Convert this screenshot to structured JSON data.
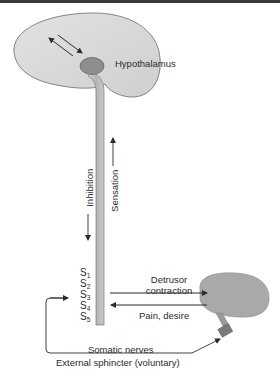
{
  "diagram": {
    "labels": {
      "hypothalamus": "Hypothalamus",
      "inhibition": "Inhibition",
      "sensation": "Sensation",
      "detrusor_line1": "Detrusor",
      "detrusor_line2": "contraction",
      "pain": "Pain, desire",
      "somatic": "Somatic nerves",
      "external_sphincter": "External sphincter (voluntary)"
    },
    "segments": [
      {
        "letter": "S",
        "num": "1"
      },
      {
        "letter": "S",
        "num": "2"
      },
      {
        "letter": "S",
        "num": "3"
      },
      {
        "letter": "S",
        "num": "4"
      },
      {
        "letter": "S",
        "num": "5"
      }
    ],
    "colors": {
      "brain_fill": "#d9d9d9",
      "hypothalamus_fill": "#8e8e8e",
      "cord_fill": "#bdbdbd",
      "bladder_fill": "#a9a9a9",
      "sphincter_fill": "#7a7a7a",
      "line": "#2b2b2b"
    }
  }
}
